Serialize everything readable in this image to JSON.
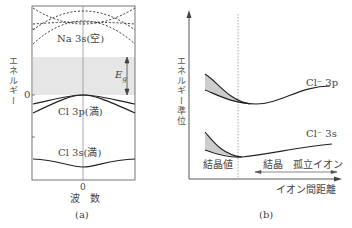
{
  "panel_a": {
    "caption": "(a)",
    "y_axis_label": "エネルギー",
    "y_zero_label": "0",
    "x_zero_label": "0",
    "x_axis_label": "波　数",
    "gap_label": "E",
    "gap_subscript": "g",
    "bands": [
      {
        "name": "Na 3s(空)",
        "style": "dashed"
      },
      {
        "name": "Cl 3p(満)",
        "style": "solid"
      },
      {
        "name": "Cl 3s(満)",
        "style": "solid"
      }
    ],
    "gap_fill_color": "#e6e6e6"
  },
  "panel_b": {
    "caption": "(b)",
    "y_axis_label": "エネルギー準位",
    "x_axis_label": "イオン間距離",
    "crystal_value_label": "結晶値",
    "range_left_label": "結晶",
    "range_right_label": "孤立イオン",
    "curves": [
      {
        "name": "Cl⁻ 3p"
      },
      {
        "name": "Cl⁻ 3s"
      }
    ],
    "shade_color": "#cccccc"
  }
}
